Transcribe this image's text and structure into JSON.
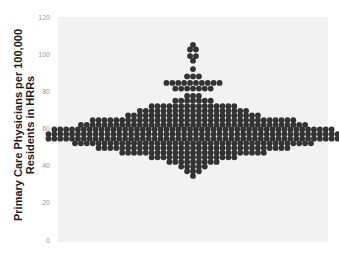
{
  "chart_data": {
    "type": "scatter",
    "subtype": "beeswarm",
    "title": "",
    "xlabel": "",
    "ylabel": "Primary Care Physicians per 100,000 Residents in HRRs",
    "ylim": [
      0,
      120
    ],
    "yticks": [
      0,
      20,
      40,
      60,
      80,
      100,
      120
    ],
    "grid": false,
    "background": "#f2f2f2",
    "dot_color": "#333333",
    "rows": [
      {
        "y": 105,
        "n": 1
      },
      {
        "y": 102.5,
        "n": 2
      },
      {
        "y": 99,
        "n": 2
      },
      {
        "y": 96.5,
        "n": 1
      },
      {
        "y": 92,
        "n": 1
      },
      {
        "y": 88,
        "n": 3
      },
      {
        "y": 84.5,
        "n": 10
      },
      {
        "y": 81.5,
        "n": 7
      },
      {
        "y": 77.5,
        "n": 3
      },
      {
        "y": 75,
        "n": 7
      },
      {
        "y": 72,
        "n": 15
      },
      {
        "y": 69.5,
        "n": 19
      },
      {
        "y": 67,
        "n": 23
      },
      {
        "y": 64.5,
        "n": 35
      },
      {
        "y": 62,
        "n": 39
      },
      {
        "y": 59.5,
        "n": 48
      },
      {
        "y": 57,
        "n": 50
      },
      {
        "y": 54.5,
        "n": 50
      },
      {
        "y": 52,
        "n": 41
      },
      {
        "y": 49.5,
        "n": 33
      },
      {
        "y": 47,
        "n": 25
      },
      {
        "y": 44.5,
        "n": 15
      },
      {
        "y": 42,
        "n": 9
      },
      {
        "y": 39.5,
        "n": 5
      },
      {
        "y": 37,
        "n": 3
      },
      {
        "y": 34.5,
        "n": 1
      }
    ]
  }
}
